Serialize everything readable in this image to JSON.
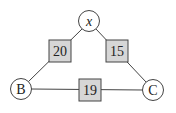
{
  "diagram": {
    "nodes": [
      {
        "id": "x",
        "label": "x",
        "italic": true
      },
      {
        "id": "B",
        "label": "B",
        "italic": false
      },
      {
        "id": "C",
        "label": "C",
        "italic": false
      }
    ],
    "edges": [
      {
        "from": "x",
        "to": "B",
        "weight": "20"
      },
      {
        "from": "x",
        "to": "C",
        "weight": "15"
      },
      {
        "from": "B",
        "to": "C",
        "weight": "19"
      }
    ],
    "colors": {
      "box_fill": "#d6d6d6",
      "stroke": "#333333",
      "node_fill": "#ffffff"
    }
  }
}
